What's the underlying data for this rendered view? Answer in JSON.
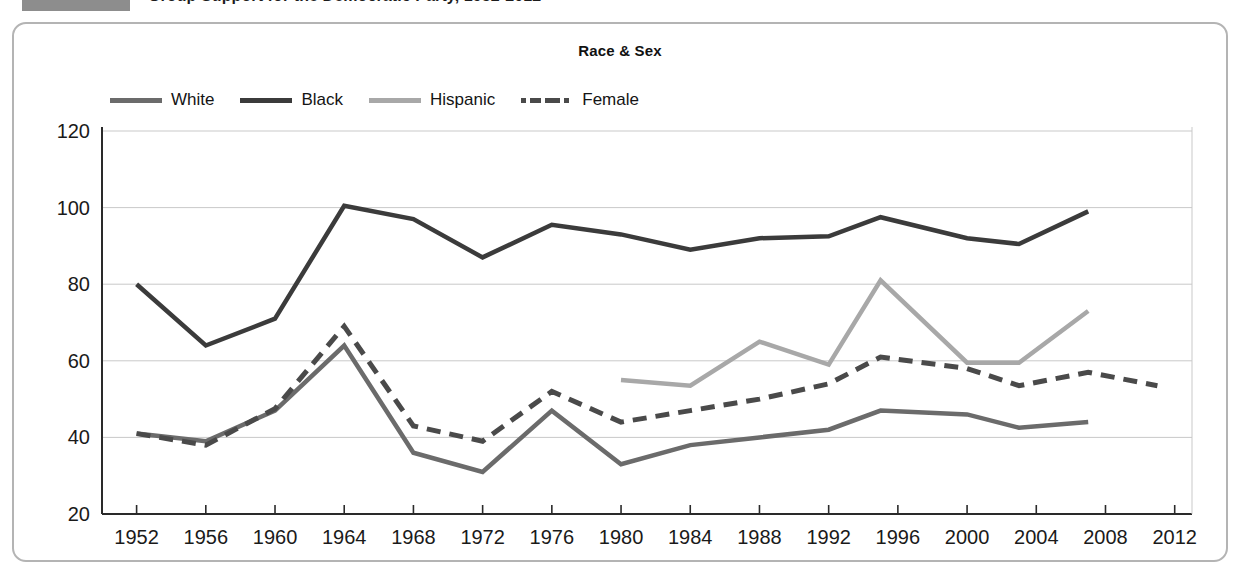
{
  "header": {
    "title": "Group Support for the Democratic Party, 1952-2012",
    "swatch_color": "#8d8d8d"
  },
  "chart_data": {
    "type": "line",
    "title": "Race & Sex",
    "xlabel": "",
    "ylabel": "",
    "x": [
      1952,
      1956,
      1960,
      1964,
      1968,
      1972,
      1976,
      1980,
      1984,
      1988,
      1992,
      1996,
      2000,
      2004,
      2008,
      2012
    ],
    "xlim": [
      1950,
      2013
    ],
    "ylim": [
      20,
      120
    ],
    "yticks": [
      20,
      40,
      60,
      80,
      100,
      120
    ],
    "xticks": [
      1952,
      1956,
      1960,
      1964,
      1968,
      1972,
      1976,
      1980,
      1984,
      1988,
      1992,
      1996,
      2000,
      2004,
      2008,
      2012
    ],
    "grid": true,
    "grid_axis": "y",
    "legend_position": "top",
    "series": [
      {
        "name": "White",
        "color": "#6b6b6b",
        "style": "solid",
        "points": [
          [
            1952,
            41
          ],
          [
            1956,
            39
          ],
          [
            1960,
            47
          ],
          [
            1964,
            64
          ],
          [
            1968,
            36
          ],
          [
            1972,
            31
          ],
          [
            1976,
            47
          ],
          [
            1980,
            33
          ],
          [
            1984,
            38
          ],
          [
            1988,
            40
          ],
          [
            1992,
            42
          ],
          [
            1995,
            47
          ],
          [
            2000,
            46
          ],
          [
            2003,
            42.5
          ],
          [
            2007,
            44
          ]
        ]
      },
      {
        "name": "Black",
        "color": "#3b3b3b",
        "style": "solid",
        "points": [
          [
            1952,
            80
          ],
          [
            1956,
            64
          ],
          [
            1960,
            71
          ],
          [
            1964,
            100.5
          ],
          [
            1968,
            97
          ],
          [
            1972,
            87
          ],
          [
            1976,
            95.5
          ],
          [
            1980,
            93
          ],
          [
            1984,
            89
          ],
          [
            1988,
            92
          ],
          [
            1992,
            92.5
          ],
          [
            1995,
            97.5
          ],
          [
            2000,
            92
          ],
          [
            2003,
            90.5
          ],
          [
            2007,
            99
          ]
        ]
      },
      {
        "name": "Hispanic",
        "color": "#a8a8a8",
        "style": "solid",
        "points": [
          [
            1980,
            55
          ],
          [
            1984,
            53.5
          ],
          [
            1988,
            65
          ],
          [
            1992,
            59
          ],
          [
            1995,
            81
          ],
          [
            2000,
            59.5
          ],
          [
            2003,
            59.5
          ],
          [
            2007,
            73
          ]
        ]
      },
      {
        "name": "Female",
        "color": "#4a4a4a",
        "style": "dashed",
        "points": [
          [
            1952,
            41
          ],
          [
            1956,
            38
          ],
          [
            1960,
            47.5
          ],
          [
            1964,
            69
          ],
          [
            1968,
            43
          ],
          [
            1972,
            39
          ],
          [
            1976,
            52
          ],
          [
            1980,
            44
          ],
          [
            1984,
            47
          ],
          [
            1988,
            50
          ],
          [
            1992,
            54
          ],
          [
            1995,
            61
          ],
          [
            2000,
            58
          ],
          [
            2003,
            53.5
          ],
          [
            2007,
            57
          ],
          [
            2011,
            53.5
          ]
        ]
      }
    ]
  },
  "axis": {
    "y_tick_labels": [
      "20",
      "40",
      "60",
      "80",
      "100",
      "120"
    ],
    "x_tick_labels": [
      "1952",
      "1956",
      "1960",
      "1964",
      "1968",
      "1972",
      "1976",
      "1980",
      "1984",
      "1988",
      "1992",
      "1996",
      "2000",
      "2004",
      "2008",
      "2012"
    ]
  },
  "legend": {
    "items": [
      {
        "label": "White",
        "color": "#6b6b6b",
        "style": "solid"
      },
      {
        "label": "Black",
        "color": "#3b3b3b",
        "style": "solid"
      },
      {
        "label": "Hispanic",
        "color": "#a8a8a8",
        "style": "solid"
      },
      {
        "label": "Female",
        "color": "#4a4a4a",
        "style": "dashed"
      }
    ]
  }
}
